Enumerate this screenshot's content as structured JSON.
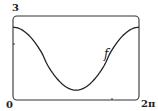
{
  "chart_data": {
    "type": "line",
    "title": "",
    "xlabel": "",
    "ylabel": "",
    "xlim": [
      0,
      6.2832
    ],
    "ylim": [
      0,
      3
    ],
    "x_tick_labels": [
      "0",
      "2π"
    ],
    "y_tick_labels": [
      "3"
    ],
    "grid": false,
    "series": [
      {
        "name": "f",
        "x": [
          0,
          0.785,
          1.571,
          2.356,
          3.1416,
          3.927,
          4.712,
          5.498,
          6.2832
        ],
        "values": [
          2.6,
          2.3,
          1.5,
          0.7,
          0.35,
          0.7,
          1.5,
          2.3,
          2.6
        ]
      }
    ],
    "annotations": [
      {
        "text": "f",
        "x": 4.9,
        "y": 1.6
      }
    ]
  },
  "labels": {
    "y_max": "3",
    "origin": "0",
    "x_max": "2π",
    "curve": "f"
  },
  "colors": {
    "curve": "#222222",
    "frame": "#333333"
  }
}
